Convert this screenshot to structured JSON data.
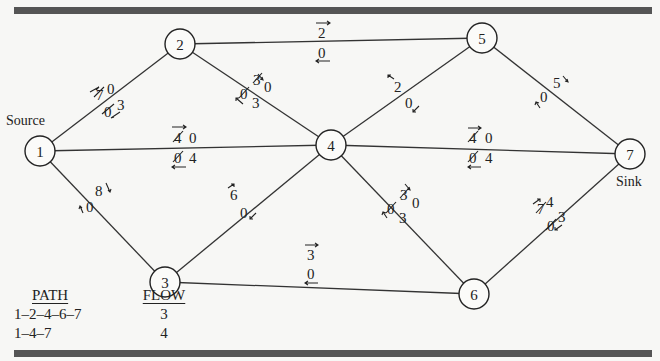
{
  "title_partial": "",
  "nodes": [
    {
      "id": "1",
      "x": 40,
      "y": 151,
      "caption": "Source"
    },
    {
      "id": "2",
      "x": 180,
      "y": 44
    },
    {
      "id": "3",
      "x": 165,
      "y": 282
    },
    {
      "id": "4",
      "x": 331,
      "y": 145
    },
    {
      "id": "5",
      "x": 482,
      "y": 38
    },
    {
      "id": "6",
      "x": 474,
      "y": 294
    },
    {
      "id": "7",
      "x": 630,
      "y": 154,
      "caption": "Sink"
    }
  ],
  "edges": [
    {
      "from": "1",
      "to": "2",
      "forward_residual_original": "7",
      "forward_residual": "0",
      "backward_residual_original": "0",
      "backward_residual": "3"
    },
    {
      "from": "1",
      "to": "4",
      "forward_residual_original": "4",
      "forward_residual": "0",
      "backward_residual_original": "0",
      "backward_residual": "4"
    },
    {
      "from": "1",
      "to": "3",
      "forward_residual": "8",
      "backward_residual": "0"
    },
    {
      "from": "2",
      "to": "5",
      "forward_residual": "2",
      "backward_residual": "0"
    },
    {
      "from": "2",
      "to": "4",
      "forward_residual_original": "3",
      "forward_residual": "0",
      "backward_residual_original": "0",
      "backward_residual": "3"
    },
    {
      "from": "4",
      "to": "5",
      "forward_residual": "2",
      "backward_residual": "0"
    },
    {
      "from": "4",
      "to": "7",
      "forward_residual_original": "4",
      "forward_residual": "0",
      "backward_residual_original": "0",
      "backward_residual": "4"
    },
    {
      "from": "3",
      "to": "4",
      "forward_residual": "6",
      "backward_residual": "0"
    },
    {
      "from": "3",
      "to": "6",
      "forward_residual": "3",
      "backward_residual": "0"
    },
    {
      "from": "4",
      "to": "6",
      "forward_residual_original": "3",
      "forward_residual": "0",
      "backward_residual_original": "0",
      "backward_residual": "3"
    },
    {
      "from": "5",
      "to": "7",
      "forward_residual": "5",
      "backward_residual": "0"
    },
    {
      "from": "6",
      "to": "7",
      "forward_residual_original": "7",
      "forward_residual": "4",
      "backward_residual_original": "0",
      "backward_residual": "3"
    }
  ],
  "labels": {
    "source": "Source",
    "sink": "Sink",
    "n1": "1",
    "n2": "2",
    "n3": "3",
    "n4": "4",
    "n5": "5",
    "n6": "6",
    "n7": "7",
    "e12_top_struck": "7",
    "e12_top": "0",
    "e12_bot_struck": "0",
    "e12_bot": "3",
    "e14_top_struck": "4",
    "e14_top": "0",
    "e14_bot_struck": "0",
    "e14_bot": "4",
    "e13_top": "8",
    "e13_bot": "0",
    "e25_top": "2",
    "e25_bot": "0",
    "e24_top_struck": "3",
    "e24_top": "0",
    "e24_bot_struck": "0",
    "e24_bot": "3",
    "e45_top": "2",
    "e45_bot": "0",
    "e47_top_struck": "4",
    "e47_top": "0",
    "e47_bot_struck": "0",
    "e47_bot": "4",
    "e34_top": "6",
    "e34_bot": "0",
    "e36_top": "3",
    "e36_bot": "0",
    "e46_top_struck": "3",
    "e46_top": "0",
    "e46_bot_struck": "0",
    "e46_bot": "3",
    "e57_top": "5",
    "e57_bot": "0",
    "e67_top_struck": "7",
    "e67_top": "4",
    "e67_bot_struck": "0",
    "e67_bot": "3"
  },
  "table": {
    "headers": {
      "path": "PATH",
      "flow": "FLOW"
    },
    "rows": [
      {
        "path": "1–2–4–6–7",
        "flow": "3"
      },
      {
        "path": "1–4–7",
        "flow": "4"
      }
    ]
  }
}
